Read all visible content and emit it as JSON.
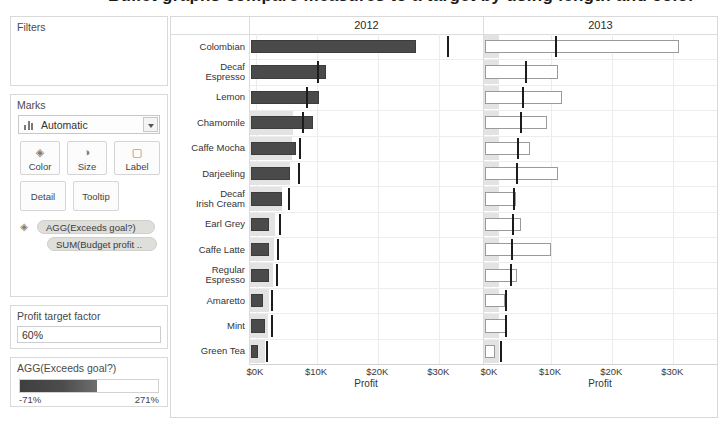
{
  "title": "Bullet graphs compare measures to a target by using length and color",
  "sidebar": {
    "filters": {
      "header": "Filters"
    },
    "marks": {
      "header": "Marks",
      "type_selected": "Automatic",
      "type_icon": "bar-chart-icon",
      "dropdown_icon": "chevron-down-icon",
      "buttons": [
        {
          "label": "Color",
          "icon": "color-palette-icon"
        },
        {
          "label": "Size",
          "icon": "size-icon"
        },
        {
          "label": "Label",
          "icon": "label-icon"
        }
      ],
      "buttons2": [
        {
          "label": "Detail",
          "icon": "detail-icon"
        },
        {
          "label": "Tooltip",
          "icon": "tooltip-icon"
        }
      ],
      "pill_icon": "color-palette-icon",
      "pills": [
        {
          "label": "AGG(Exceeds goal?)"
        },
        {
          "label": "SUM(Budget profit .."
        }
      ]
    },
    "parameter": {
      "header": "Profit target factor",
      "value": "60%"
    },
    "legend": {
      "header": "AGG(Exceeds goal?)",
      "min": "-71%",
      "max": "271%",
      "color_low": "#3f3f3f",
      "color_high": "#ffffff"
    }
  },
  "chart_data": {
    "type": "bar",
    "title": "Bullet graphs compare measures to a target by using length and color",
    "xlabel": "Profit",
    "ylabel": "",
    "xlim": [
      0,
      36000
    ],
    "xticks": [
      0,
      10000,
      20000,
      30000
    ],
    "xticklabels": [
      "$0K",
      "$10K",
      "$20K",
      "$30K"
    ],
    "grid": true,
    "legend_position": "sidebar",
    "panels": [
      "2012",
      "2013"
    ],
    "categories": [
      "Colombian",
      "Decaf Espresso",
      "Lemon",
      "Chamomile",
      "Caffe Mocha",
      "Darjeeling",
      "Decaf Irish Cream",
      "Earl Grey",
      "Caffe Latte",
      "Regular Espresso",
      "Amaretto",
      "Mint",
      "Green Tea"
    ],
    "series": [
      {
        "name": "2012 Profit",
        "panel": "2012",
        "values": [
          26200,
          11400,
          10300,
          9400,
          6600,
          5600,
          4300,
          2200,
          2200,
          2200,
          1200,
          1400,
          300
        ]
      },
      {
        "name": "2012 Budget reference (60% target)",
        "panel": "2012",
        "values": [
          31200,
          9900,
          8200,
          7600,
          7100,
          6800,
          5200,
          3800,
          3500,
          3300,
          2500,
          2400,
          1700
        ]
      },
      {
        "name": "2012 Budget range band",
        "panel": "2012",
        "values": [
          0,
          0,
          0,
          6100,
          5900,
          5600,
          4300,
          3100,
          2900,
          2700,
          2100,
          2000,
          1400
        ]
      },
      {
        "name": "2013 Profit",
        "panel": "2013",
        "values": [
          30900,
          11200,
          11800,
          9300,
          6500,
          11100,
          4300,
          5000,
          10000,
          4400,
          2400,
          2800,
          800
        ]
      },
      {
        "name": "2013 Budget reference (60% target)",
        "panel": "2013",
        "values": [
          10600,
          5800,
          5300,
          4900,
          4400,
          4200,
          3800,
          3600,
          3500,
          3300,
          2500,
          2400,
          1700
        ]
      },
      {
        "name": "2013 Budget range band",
        "panel": "2013",
        "values": [
          1400,
          1400,
          1400,
          1400,
          1400,
          1400,
          1400,
          1400,
          1400,
          1400,
          1400,
          1400,
          1400
        ]
      }
    ]
  }
}
